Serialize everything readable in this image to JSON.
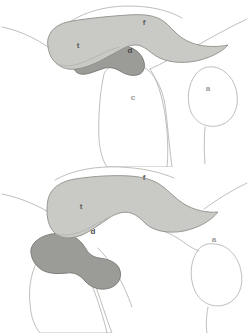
{
  "figure": {
    "background_color": "#ffffff",
    "width": 249,
    "height": 333
  },
  "colors": {
    "light_region_fill": "#c9c9c5",
    "light_region_stroke": "#8e8e8a",
    "dark_region_fill": "#9b9b97",
    "dark_region_stroke": "#767672",
    "outline_stroke": "#b2b2b0",
    "label_text": "#5d5d5a"
  },
  "panels": [
    {
      "id": "upper-panel",
      "name": "Upper panel",
      "labels": [
        {
          "key": "t",
          "text": "t",
          "x": 78,
          "y": 46,
          "shading": "light"
        },
        {
          "key": "f",
          "text": "f",
          "x": 144,
          "y": 23,
          "shading": "light"
        },
        {
          "key": "d",
          "text": "d",
          "x": 130,
          "y": 51,
          "shading": "dark"
        },
        {
          "key": "c",
          "text": "c",
          "x": 133,
          "y": 98,
          "shading": "white"
        },
        {
          "key": "a",
          "text": "a",
          "x": 208,
          "y": 89,
          "shading": "white"
        }
      ]
    },
    {
      "id": "lower-panel",
      "name": "Lower panel",
      "labels": [
        {
          "key": "t",
          "text": "t",
          "x": 81,
          "y": 207,
          "shading": "light"
        },
        {
          "key": "f",
          "text": "f",
          "x": 144,
          "y": 178,
          "shading": "light"
        },
        {
          "key": "d",
          "text": "d",
          "x": 93,
          "y": 232,
          "shading": "dark"
        },
        {
          "key": "c",
          "text": "c",
          "x": 73,
          "y": 264,
          "shading": "white"
        },
        {
          "key": "a",
          "text": "a",
          "x": 214,
          "y": 240,
          "shading": "white"
        }
      ]
    }
  ]
}
